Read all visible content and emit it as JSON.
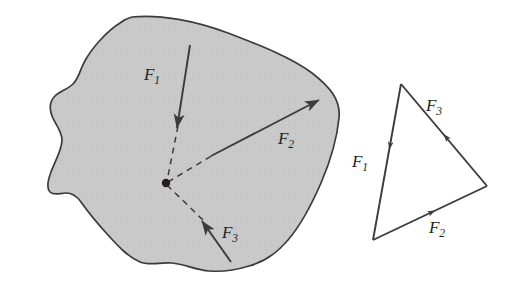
{
  "figure": {
    "colors": {
      "body_fill": "#c9c9c9",
      "body_outline": "#3b3b3b",
      "vector_stroke": "#3b3b3b",
      "label_text": "#231f20",
      "background": "#ffffff"
    }
  },
  "body_diagram": {
    "name": "free-body-blob",
    "concurrency_point": {
      "x": 166,
      "y": 183
    },
    "forces": [
      {
        "id": "F1",
        "label": "F",
        "subscript": "1",
        "label_x": 152,
        "label_y": 80,
        "tail": {
          "x": 190,
          "y": 45
        },
        "head": {
          "x": 177,
          "y": 128
        },
        "direction": "down-left",
        "line_of_action": "dashed-to-point"
      },
      {
        "id": "F2",
        "label": "F",
        "subscript": "2",
        "label_x": 286,
        "label_y": 144,
        "tail": {
          "x": 211,
          "y": 156
        },
        "head": {
          "x": 319,
          "y": 100
        },
        "direction": "up-right",
        "line_of_action": "dashed-to-point"
      },
      {
        "id": "F3",
        "label": "F",
        "subscript": "3",
        "label_x": 230,
        "label_y": 238,
        "tail": {
          "x": 231,
          "y": 262
        },
        "head": {
          "x": 202,
          "y": 221
        },
        "direction": "up-left",
        "line_of_action": "dashed-to-point"
      }
    ]
  },
  "force_triangle": {
    "name": "force-triangle",
    "closed": true,
    "vertices": {
      "apex": {
        "x": 401,
        "y": 84
      },
      "bottom_left": {
        "x": 373,
        "y": 240
      },
      "right": {
        "x": 487,
        "y": 186
      }
    },
    "edges": [
      {
        "id": "F1",
        "label": "F",
        "subscript": "1",
        "label_x": 360,
        "label_y": 167,
        "from": "apex",
        "to": "bottom_left",
        "arrow_at": {
          "x": 387,
          "y": 150
        },
        "direction": "down-left"
      },
      {
        "id": "F2",
        "label": "F",
        "subscript": "2",
        "label_x": 437,
        "label_y": 233,
        "from": "bottom_left",
        "to": "right",
        "arrow_at": {
          "x": 432,
          "y": 213
        },
        "direction": "up-right"
      },
      {
        "id": "F3",
        "label": "F",
        "subscript": "3",
        "label_x": 434,
        "label_y": 111,
        "from": "right",
        "to": "apex",
        "arrow_at": {
          "x": 442,
          "y": 137
        },
        "direction": "up-left"
      }
    ]
  }
}
